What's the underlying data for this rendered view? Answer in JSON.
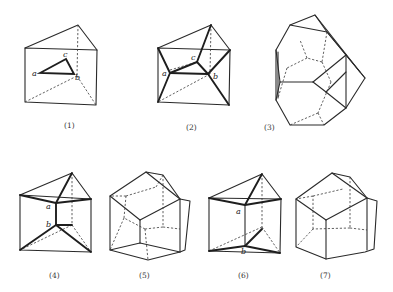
{
  "figure": {
    "panels": [
      {
        "id": 1,
        "caption": "(1)",
        "points": [
          "a",
          "c",
          "b"
        ]
      },
      {
        "id": 2,
        "caption": "(2)",
        "points": [
          "a",
          "c",
          "b"
        ]
      },
      {
        "id": 3,
        "caption": "(3)",
        "points": []
      },
      {
        "id": 4,
        "caption": "(4)",
        "points": [
          "a",
          "b"
        ]
      },
      {
        "id": 5,
        "caption": "(5)",
        "points": []
      },
      {
        "id": 6,
        "caption": "(6)",
        "points": [
          "a",
          "b"
        ]
      },
      {
        "id": 7,
        "caption": "(7)",
        "points": []
      }
    ]
  },
  "labels": {
    "p1": {
      "caption": "(1)",
      "a": "a",
      "b": "b",
      "c": "c"
    },
    "p2": {
      "caption": "(2)",
      "a": "a",
      "b": "b",
      "c": "c"
    },
    "p3": {
      "caption": "(3)"
    },
    "p4": {
      "caption": "(4)",
      "a": "a",
      "b": "b"
    },
    "p5": {
      "caption": "(5)"
    },
    "p6": {
      "caption": "(6)",
      "a": "a",
      "b": "b"
    },
    "p7": {
      "caption": "(7)"
    }
  },
  "colors": {
    "line": "#2a2a2a",
    "background": "#ffffff"
  }
}
